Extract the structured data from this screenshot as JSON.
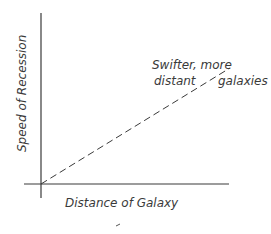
{
  "chart_data": {
    "type": "line",
    "title": "",
    "xlabel": "Distance of Galaxy",
    "ylabel": "Speed of Recession",
    "xlim": [
      0,
      1
    ],
    "ylim": [
      0,
      1
    ],
    "grid": false,
    "series": [
      {
        "name": "Hubble relation",
        "style": "dashed",
        "x": [
          0,
          1
        ],
        "y": [
          0,
          0.63
        ]
      }
    ],
    "annotations": [
      {
        "line1": "Swifter, more",
        "line2_left": "distant",
        "line2_right": "galaxies"
      }
    ],
    "colors": {
      "ink": "#3a3a3a",
      "background": "#ffffff"
    }
  }
}
